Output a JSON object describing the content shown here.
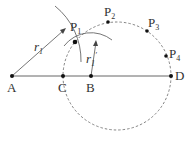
{
  "diagram": {
    "points": {
      "A": {
        "label": "A",
        "x": 12,
        "y": 76
      },
      "C": {
        "label": "C",
        "x": 63,
        "y": 76
      },
      "B": {
        "label": "B",
        "x": 91,
        "y": 76
      },
      "D": {
        "label": "D",
        "x": 171,
        "y": 76
      },
      "P1": {
        "label": "P",
        "sub": "1",
        "x": 75,
        "y": 42
      },
      "P2": {
        "label": "P",
        "sub": "2",
        "x": 108,
        "y": 22
      },
      "P3": {
        "label": "P",
        "sub": "3",
        "x": 147,
        "y": 31
      },
      "P4": {
        "label": "P",
        "sub": "4",
        "x": 166,
        "y": 56
      }
    },
    "radii": {
      "r1": {
        "label": "r",
        "sub": "1"
      },
      "r1p": {
        "label": "r",
        "sub": "1",
        "prime": "′"
      }
    },
    "dashed_circle": {
      "cx": 117,
      "cy": 76,
      "r": 54
    },
    "line_color": "#555555"
  }
}
